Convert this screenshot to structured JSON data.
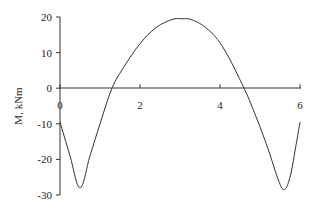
{
  "chart_data": {
    "type": "line",
    "title": "",
    "xlabel": "",
    "ylabel": "M, kNm",
    "xlim": [
      0,
      6
    ],
    "ylim": [
      -30,
      20
    ],
    "x_ticks": [
      "0",
      "2",
      "4",
      "6"
    ],
    "y_ticks": [
      "20",
      "10",
      "0",
      "-10",
      "-20",
      "-30"
    ],
    "grid": false,
    "legend": null,
    "series": [
      {
        "name": "M",
        "x": [
          0,
          0.25,
          0.5,
          0.75,
          1.0,
          1.3,
          1.6,
          2.0,
          2.4,
          2.8,
          3.05,
          3.3,
          3.7,
          4.1,
          4.6,
          4.9,
          5.2,
          5.45,
          5.6,
          5.75,
          5.9,
          6.0
        ],
        "values": [
          -9.5,
          -19,
          -28,
          -19,
          -10,
          0,
          6,
          12.5,
          17,
          19.3,
          19.5,
          19.2,
          16.5,
          11,
          0,
          -8,
          -17,
          -25.5,
          -28.5,
          -25,
          -16,
          -9.5
        ]
      }
    ]
  }
}
